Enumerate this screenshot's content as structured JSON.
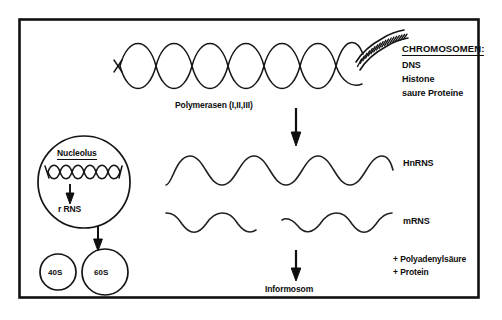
{
  "figure": {
    "title_hidden": "Transkription: vom Chromosom zum Informosom",
    "frame_color": "#111111",
    "ink_color": "#0d0d0d",
    "background_color": "#ffffff"
  },
  "chromosome_block": {
    "header": "CHROMOSOMEN:",
    "components": [
      "DNS",
      "Histone",
      "saure Proteine"
    ]
  },
  "labels": {
    "polymerasen": "Polymerasen (I,II,III)",
    "hnrns": "HnRNS",
    "mrns": "mRNS",
    "informosom": "Informosom"
  },
  "additions": [
    "+ Polyadenylsäure",
    "+ Protein"
  ],
  "nucleolus": {
    "title": "Nucleolus",
    "product": "r RNS",
    "subunits": [
      {
        "label": "40S"
      },
      {
        "label": "60S"
      }
    ]
  },
  "strands": {
    "dna_double_helix": {
      "name": "dna-double-helix",
      "loops": 6,
      "amplitude": 26
    },
    "chromatin_coil": {
      "name": "chromatin-coil",
      "turns": 16
    },
    "hnrns_wave": {
      "name": "hnrns-wave",
      "cycles": 3
    },
    "mrns_wave_left": {
      "name": "mrns-wave-left",
      "cycles": 1.5
    },
    "mrns_wave_right": {
      "name": "mrns-wave-right",
      "cycles": 1.5
    },
    "nucleolar_dna": {
      "name": "nucleolar-dna-helix",
      "loops": 9
    }
  },
  "arrows": [
    {
      "name": "arrow-transcription-to-hnrns",
      "from": "chromosome",
      "to": "HnRNS"
    },
    {
      "name": "arrow-mrns-to-informosom",
      "from": "mRNS",
      "to": "Informosom"
    },
    {
      "name": "arrow-nucleolus-to-rrns",
      "from": "nucleolar DNA",
      "to": "r RNS"
    },
    {
      "name": "arrow-rrns-to-subunits",
      "from": "r RNS",
      "to": "60S"
    }
  ]
}
